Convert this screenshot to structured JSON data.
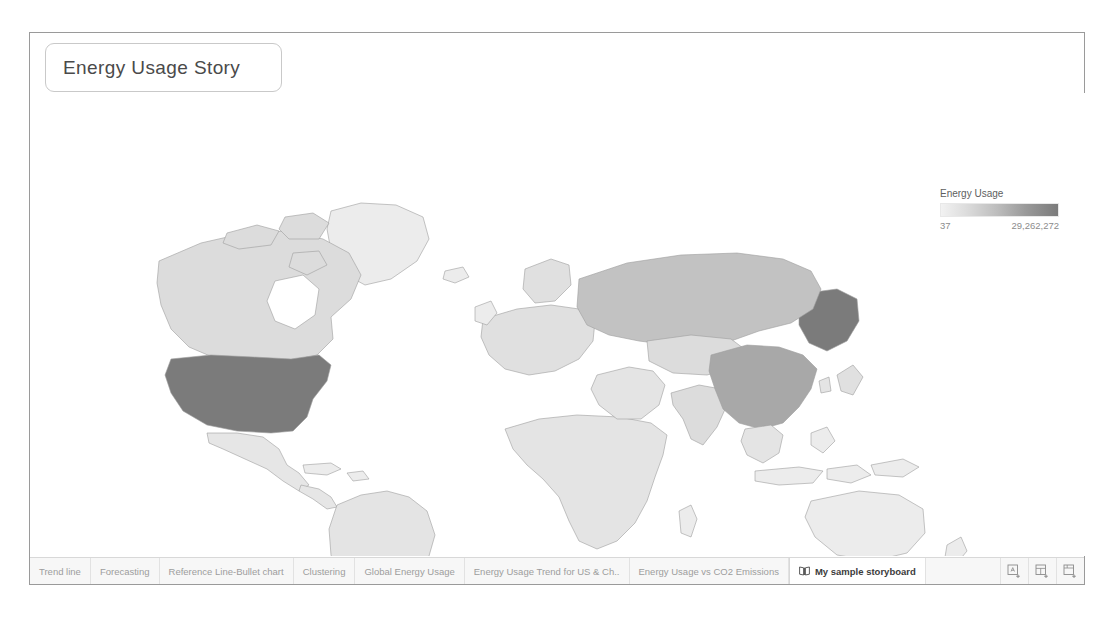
{
  "app": {
    "story_title": "Energy Usage Story"
  },
  "navigator": {
    "story_points": [
      {
        "label": "Energy usage across the Globe",
        "active": true
      },
      {
        "label": "Energy usage trend across years for US & China",
        "active": false
      },
      {
        "label": "Energy usage vs CO2 emission trend across years for US & China",
        "active": false
      }
    ],
    "buttons": [
      {
        "label": "New Blank Point",
        "name": "new-blank-point-button"
      },
      {
        "label": "Duplicate",
        "name": "duplicate-button"
      }
    ]
  },
  "legend": {
    "title": "Energy Usage",
    "min": "37",
    "max": "29,262,272",
    "gradient_from": "#f2f2f2",
    "gradient_to": "#7b7b7b"
  },
  "map": {
    "attribution": "© OpenStreetMap contributors",
    "highlights": [
      {
        "country": "United States",
        "shade": "dark"
      },
      {
        "country": "Alaska",
        "shade": "dark"
      },
      {
        "country": "China",
        "shade": "medium-dark"
      },
      {
        "country": "Russia",
        "shade": "medium"
      },
      {
        "country": "Canada",
        "shade": "light"
      }
    ]
  },
  "tabbar": {
    "sheets": [
      {
        "label": "Trend line",
        "active": false
      },
      {
        "label": "Forecasting",
        "active": false
      },
      {
        "label": "Reference Line-Bullet chart",
        "active": false
      },
      {
        "label": "Clustering",
        "active": false
      },
      {
        "label": "Global Energy Usage",
        "active": false
      },
      {
        "label": "Energy Usage Trend for US & Ch..",
        "active": false
      },
      {
        "label": "Energy Usage vs CO2 Emissions",
        "active": false
      },
      {
        "label": "My sample storyboard",
        "active": true,
        "icon": "story-book-icon"
      }
    ],
    "new_buttons": [
      {
        "name": "new-worksheet-icon"
      },
      {
        "name": "new-dashboard-icon"
      },
      {
        "name": "new-story-icon"
      }
    ]
  }
}
